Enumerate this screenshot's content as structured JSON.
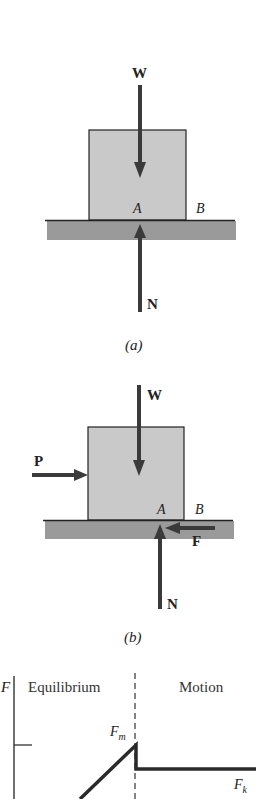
{
  "diagram_a": {
    "caption": "(a)",
    "labels": {
      "weight": "W",
      "normal": "N",
      "point_a": "A",
      "point_b": "B"
    }
  },
  "diagram_b": {
    "caption": "(b)",
    "labels": {
      "weight": "W",
      "normal": "N",
      "push": "P",
      "friction": "F",
      "point_a": "A",
      "point_b": "B"
    }
  },
  "graph": {
    "y_axis_label": "F",
    "region_left": "Equilibrium",
    "region_right": "Motion",
    "peak_label": "F",
    "peak_sub": "m",
    "kinetic_label": "F",
    "kinetic_sub": "k"
  },
  "colors": {
    "block": "#c9c9c9",
    "ground": "#9a9a9a",
    "arrow": "#3a3a3a",
    "line": "#222222"
  }
}
